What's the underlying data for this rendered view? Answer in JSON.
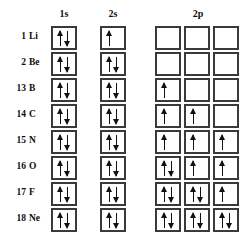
{
  "headers": {
    "col_label": "Group",
    "col_symbol": "Element",
    "orbitals": [
      "1s",
      "2s",
      "2p"
    ]
  },
  "colors": {
    "box_border": "#3a3a3a",
    "arrow": "#111111",
    "text": "#0d0d0d",
    "background": "#ffffff"
  },
  "legend": {
    "up_arrow": "up-arrow",
    "down_arrow": "down-arrow",
    "empty_box": "empty-orbital-box"
  },
  "rows": [
    {
      "group": "1",
      "symbol": "Li",
      "orbital_1s": [
        "up",
        "down"
      ],
      "orbital_2s": [
        "up"
      ],
      "orbital_2p": [
        [],
        [],
        []
      ]
    },
    {
      "group": "2",
      "symbol": "Be",
      "orbital_1s": [
        "up",
        "down"
      ],
      "orbital_2s": [
        "up",
        "down"
      ],
      "orbital_2p": [
        [],
        [],
        []
      ]
    },
    {
      "group": "13",
      "symbol": "B",
      "orbital_1s": [
        "up",
        "down"
      ],
      "orbital_2s": [
        "up",
        "down"
      ],
      "orbital_2p": [
        [
          "up"
        ],
        [],
        []
      ]
    },
    {
      "group": "14",
      "symbol": "C",
      "orbital_1s": [
        "up",
        "down"
      ],
      "orbital_2s": [
        "up",
        "down"
      ],
      "orbital_2p": [
        [
          "up"
        ],
        [
          "up"
        ],
        []
      ]
    },
    {
      "group": "15",
      "symbol": "N",
      "orbital_1s": [
        "up",
        "down"
      ],
      "orbital_2s": [
        "up",
        "down"
      ],
      "orbital_2p": [
        [
          "up"
        ],
        [
          "up"
        ],
        [
          "up"
        ]
      ]
    },
    {
      "group": "16",
      "symbol": "O",
      "orbital_1s": [
        "up",
        "down"
      ],
      "orbital_2s": [
        "up",
        "down"
      ],
      "orbital_2p": [
        [
          "up",
          "down"
        ],
        [
          "up"
        ],
        [
          "up"
        ]
      ]
    },
    {
      "group": "17",
      "symbol": "F",
      "orbital_1s": [
        "up",
        "down"
      ],
      "orbital_2s": [
        "up",
        "down"
      ],
      "orbital_2p": [
        [
          "up",
          "down"
        ],
        [
          "up",
          "down"
        ],
        [
          "up"
        ]
      ]
    },
    {
      "group": "18",
      "symbol": "Ne",
      "orbital_1s": [
        "up",
        "down"
      ],
      "orbital_2s": [
        "up",
        "down"
      ],
      "orbital_2p": [
        [
          "up",
          "down"
        ],
        [
          "up",
          "down"
        ],
        [
          "up",
          "down"
        ]
      ]
    }
  ]
}
